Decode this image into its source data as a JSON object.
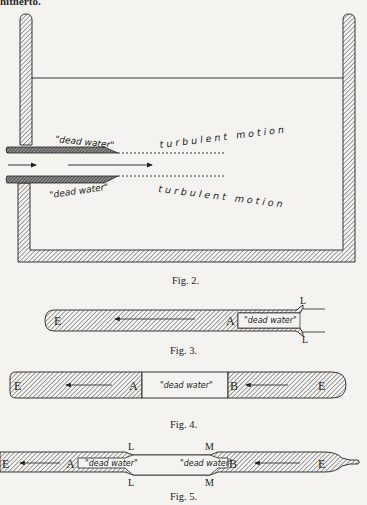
{
  "page": {
    "top_bleed_heading": "hitherto.",
    "colors": {
      "paper": "#f4f3f0",
      "ink": "#1e1e1e",
      "hatch": "#444444"
    }
  },
  "figures": [
    {
      "id": "fig2",
      "caption": "Fig. 2.",
      "description": "Tank with walls, water surface line, two nozzle plates issuing a jet; dead water zones behind plate edges and turbulent motion downstream",
      "labels": {
        "dead_water_upper": "\"dead water\"",
        "dead_water_lower": "\"dead water\"",
        "turbulent_upper": "turbulent motion",
        "turbulent_lower": "turbulent motion"
      }
    },
    {
      "id": "fig3",
      "caption": "Fig. 3.",
      "labels": {
        "E": "E",
        "A": "A",
        "L_top": "L",
        "L_bottom": "L",
        "dead_water": "\"dead water\""
      }
    },
    {
      "id": "fig4",
      "caption": "Fig. 4.",
      "labels": {
        "E_left": "E",
        "A": "A",
        "dead_water": "\"dead water\"",
        "B": "B",
        "E_right": "E"
      }
    },
    {
      "id": "fig5",
      "caption": "Fig. 5.",
      "labels": {
        "E_left": "E",
        "A": "A",
        "L_top": "L",
        "L_bottom": "L",
        "dead_water_left": "\"dead water\"",
        "M_top": "M",
        "M_bottom": "M",
        "dead_water_right": "\"dead water\"",
        "B": "B",
        "E_right": "E"
      }
    }
  ]
}
